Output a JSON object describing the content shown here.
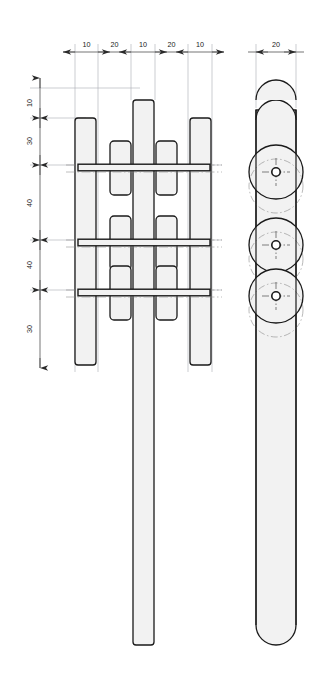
{
  "drawing": {
    "title": "Mechanical assembly orthographic drawing",
    "background_color": "#ffffff",
    "part_fill_color": "#f2f2f2",
    "outline_color": "#1a1a1a",
    "dimension_line_color": "#3a3a3a",
    "extension_line_color": "#9aa0a6",
    "centerline_color": "#8a8a8a",
    "views": [
      {
        "id": "front-view",
        "name": "Front view"
      },
      {
        "id": "side-view",
        "name": "Side view"
      }
    ]
  },
  "dimensions": {
    "horizontal_top": {
      "name": "front-view-width-chain",
      "labels": [
        "10",
        "20",
        "10",
        "20",
        "10"
      ],
      "unit": "mm"
    },
    "horizontal_right": {
      "name": "side-view-width",
      "labels": [
        "20"
      ],
      "unit": "mm"
    },
    "vertical_left": {
      "name": "front-view-height-chain",
      "labels": [
        "10",
        "30",
        "40",
        "40",
        "30"
      ],
      "unit": "mm"
    }
  },
  "features": {
    "pin_rows": 3,
    "outer_plates": 2,
    "inner_plates": 4,
    "center_shaft": 1,
    "side_discs": 3
  },
  "dim_values": {
    "h1": "10",
    "h2": "20",
    "h3": "10",
    "h4": "20",
    "h5": "10",
    "r1": "20",
    "v1": "10",
    "v2": "30",
    "v3": "40",
    "v4": "40",
    "v5": "30"
  }
}
